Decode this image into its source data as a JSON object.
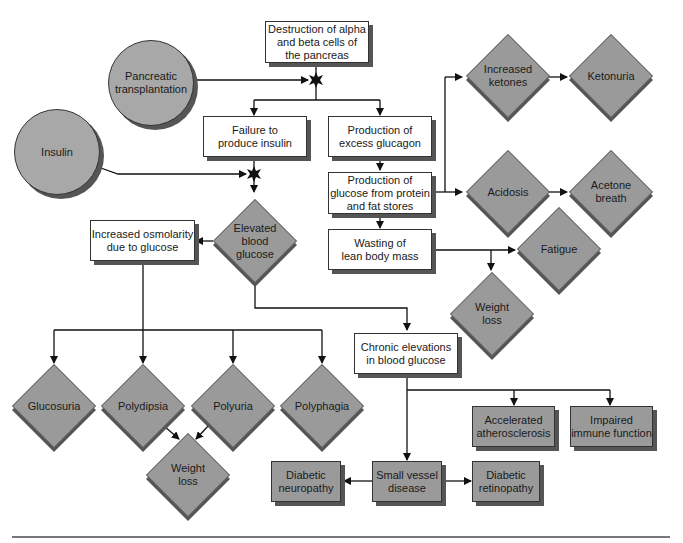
{
  "diagram": {
    "title_node": "Destruction of alpha\nand beta cells of\nthe pancreas",
    "circles": {
      "pancreatic_transplantation": "Pancreatic\ntransplantation",
      "insulin": "Insulin"
    },
    "boxes": {
      "failure_insulin": "Failure to\nproduce insulin",
      "excess_glucagon": "Production of\nexcess glucagon",
      "glucose_from_protein": "Production of\nglucose from protein\nand fat stores",
      "wasting": "Wasting of\nlean body mass",
      "increased_osmolarity": "Increased osmolarity\ndue to glucose",
      "chronic_elevations": "Chronic elevations\nin blood glucose"
    },
    "gray_boxes": {
      "accelerated_atherosclerosis": "Accelerated\natherosclerosis",
      "impaired_immune": "Impaired\nimmune function",
      "diabetic_neuropathy": "Diabetic\nneuropathy",
      "small_vessel": "Small vessel\ndisease",
      "diabetic_retinopathy": "Diabetic\nretinopathy"
    },
    "diamonds": {
      "increased_ketones": "Increased\nketones",
      "ketonuria": "Ketonuria",
      "acidosis": "Acidosis",
      "acetone_breath": "Acetone\nbreath",
      "fatigue": "Fatigue",
      "weight_loss_top": "Weight\nloss",
      "elevated_glucose": "Elevated\nblood\nglucose",
      "glucosuria": "Glucosuria",
      "polydipsia": "Polydipsia",
      "polyuria": "Polyuria",
      "polyphagia": "Polyphagia",
      "weight_loss_bottom": "Weight\nloss"
    },
    "colors": {
      "box_fill": "#ffffff",
      "shape_fill": "#9a9a9a",
      "circle_fill": "#a8a8a8",
      "shadow": "#555555",
      "line": "#111111"
    }
  }
}
